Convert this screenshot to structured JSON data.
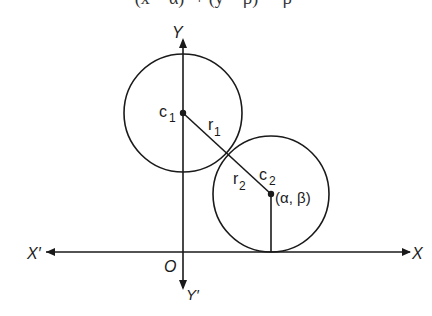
{
  "top_cutoff_text": "(x − α)² + (y − β)² = β²",
  "colors": {
    "stroke": "#1a1a1a",
    "background": "#ffffff"
  },
  "axes": {
    "x_label": "X",
    "x_prime_label": "X′",
    "y_label": "Y",
    "y_prime_label": "Y′",
    "origin_label": "O"
  },
  "circle1": {
    "center_label": "c",
    "center_sub": "1",
    "radius_label": "r",
    "radius_sub": "1"
  },
  "circle2": {
    "center_label": "c",
    "center_sub": "2",
    "radius_label": "r",
    "radius_sub": "2",
    "coords_label": "(α, β)"
  }
}
